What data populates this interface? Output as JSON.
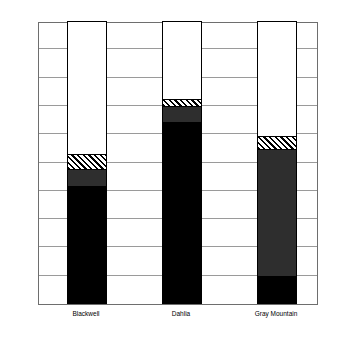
{
  "chart_data": {
    "type": "bar",
    "subtype": "stacked-bar-100-percent",
    "title": "",
    "xlabel": "",
    "ylabel": "",
    "categories": [
      "Blackwell",
      "Dahlia",
      "Gray Mountain"
    ],
    "ylim": [
      0,
      100
    ],
    "ytick_labels": [
      "0%",
      "10%",
      "20%",
      "30%",
      "40%",
      "50%",
      "60%",
      "70%",
      "80%",
      "90%",
      "100%"
    ],
    "ytick_values": [
      0,
      10,
      20,
      30,
      40,
      50,
      60,
      70,
      80,
      90,
      100
    ],
    "grid": true,
    "legend": "none",
    "series": [
      {
        "name": "black",
        "fill": "solid-black",
        "color": "#000000",
        "values": [
          41.5,
          64.0,
          9.5
        ]
      },
      {
        "name": "dark-gray",
        "fill": "solid-dark-gray",
        "color": "#2e2e2e",
        "values": [
          6.0,
          5.5,
          45.0
        ]
      },
      {
        "name": "hatched",
        "fill": "diagonal-hatch",
        "color": "#000000",
        "values": [
          5.0,
          2.5,
          4.5
        ]
      },
      {
        "name": "white",
        "fill": "solid-white",
        "color": "#ffffff",
        "values": [
          47.5,
          28.0,
          41.0
        ]
      }
    ],
    "cumulative_tops": {
      "Blackwell": [
        41.5,
        47.5,
        52.5,
        100.0
      ],
      "Dahlia": [
        64.0,
        69.5,
        72.0,
        100.0
      ],
      "Gray Mountain": [
        9.5,
        54.5,
        59.0,
        100.0
      ]
    }
  },
  "axis": {
    "ticks": [
      {
        "label": "100%",
        "value": 100
      },
      {
        "label": "90%",
        "value": 90
      },
      {
        "label": "80%",
        "value": 80
      },
      {
        "label": "70%",
        "value": 70
      },
      {
        "label": "60%",
        "value": 60
      },
      {
        "label": "50%",
        "value": 50
      },
      {
        "label": "40%",
        "value": 40
      },
      {
        "label": "30%",
        "value": 30
      },
      {
        "label": "20%",
        "value": 20
      },
      {
        "label": "10%",
        "value": 10
      },
      {
        "label": "0%",
        "value": 0
      }
    ]
  },
  "categories": [
    {
      "label": "Blackwell"
    },
    {
      "label": "Dahlia"
    },
    {
      "label": "Gray Mountain"
    }
  ],
  "colors": {
    "frame": "#6e6e6e",
    "gridline": "#9a9a9a",
    "bar_outline": "#000000",
    "segment_black": "#000000",
    "segment_gray": "#2e2e2e",
    "segment_white": "#ffffff",
    "background": "#ffffff",
    "text": "#000000"
  }
}
